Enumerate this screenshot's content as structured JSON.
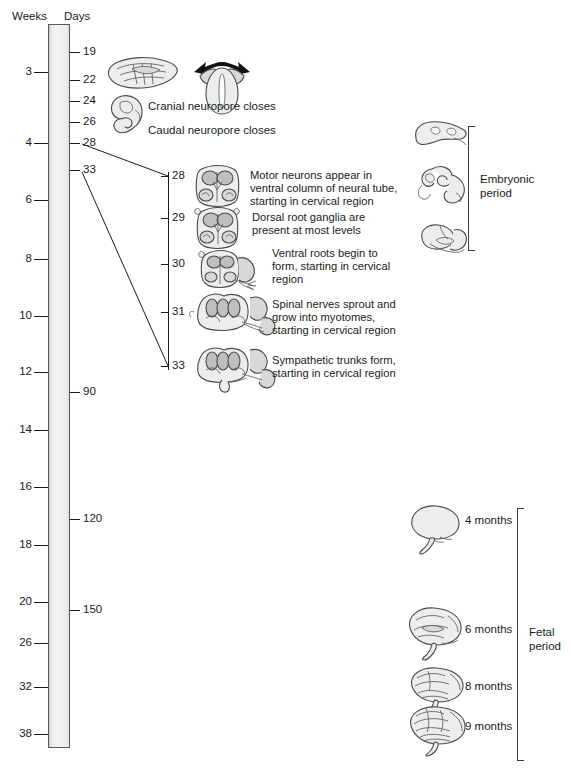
{
  "axes": {
    "weeks_header": "Weeks",
    "days_header": "Days",
    "weeks_ticks": [
      {
        "label": "3",
        "y": 72
      },
      {
        "label": "4",
        "y": 143
      },
      {
        "label": "6",
        "y": 200
      },
      {
        "label": "8",
        "y": 259
      },
      {
        "label": "10",
        "y": 316
      },
      {
        "label": "12",
        "y": 372
      },
      {
        "label": "14",
        "y": 430
      },
      {
        "label": "16",
        "y": 487
      },
      {
        "label": "18",
        "y": 545
      },
      {
        "label": "20",
        "y": 602
      },
      {
        "label": "26",
        "y": 643
      },
      {
        "label": "32",
        "y": 687
      },
      {
        "label": "38",
        "y": 734
      }
    ],
    "days_ticks": [
      {
        "label": "19",
        "y": 52
      },
      {
        "label": "22",
        "y": 80
      },
      {
        "label": "24",
        "y": 101
      },
      {
        "label": "26",
        "y": 122
      },
      {
        "label": "28",
        "y": 143
      },
      {
        "label": "33",
        "y": 170
      },
      {
        "label": "90",
        "y": 392
      },
      {
        "label": "120",
        "y": 519
      },
      {
        "label": "150",
        "y": 610
      }
    ]
  },
  "early_events": {
    "cranial_neuropore": "Cranial neuropore closes",
    "caudal_neuropore": "Caudal neuropore closes"
  },
  "detail": {
    "ticks": [
      {
        "day": "28",
        "y": 176
      },
      {
        "day": "29",
        "y": 218
      },
      {
        "day": "30",
        "y": 264
      },
      {
        "day": "31",
        "y": 312
      },
      {
        "day": "33",
        "y": 366
      }
    ],
    "events": [
      {
        "day": "28",
        "lines": [
          "Motor neurons appear in",
          "ventral column of neural tube,",
          "starting in cervical region"
        ]
      },
      {
        "day": "29",
        "lines": [
          "Dorsal root ganglia are",
          "present at most levels"
        ]
      },
      {
        "day": "30",
        "lines": [
          "Ventral roots begin to",
          "form, starting in cervical",
          "region"
        ]
      },
      {
        "day": "31",
        "lines": [
          "Spinal nerves sprout and",
          "grow into myotomes,",
          "starting in cervical region"
        ]
      },
      {
        "day": "33",
        "lines": [
          "Sympathetic trunks form,",
          "starting in cervical region"
        ]
      }
    ]
  },
  "periods": {
    "embryonic": {
      "line1": "Embryonic",
      "line2": "period"
    },
    "fetal": {
      "line1": "Fetal",
      "line2": "period"
    }
  },
  "brain_stages": [
    {
      "label": "4 months",
      "y": 521
    },
    {
      "label": "6 months",
      "y": 630
    },
    {
      "label": "8 months",
      "y": 687
    },
    {
      "label": "9 months",
      "y": 727
    }
  ],
  "colors": {
    "bar_fill": "#f0f0f0",
    "bar_stroke": "#5a5a5a",
    "ink": "#1a1a1a",
    "drawing_stroke": "#4a4a4a",
    "drawing_fill": "#dcdcdc"
  }
}
